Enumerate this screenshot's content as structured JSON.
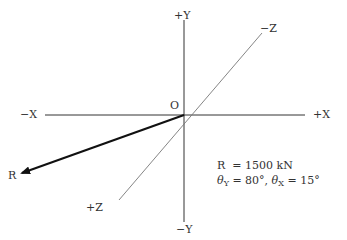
{
  "diagram": {
    "type": "3d-force-vector",
    "origin_label": "O",
    "axes": {
      "pos_y": "+Y",
      "neg_y": "−Y",
      "pos_x": "+X",
      "neg_x": "−X",
      "pos_z": "+Z",
      "neg_z": "−Z"
    },
    "vector": {
      "label": "R",
      "direction": "toward -X, -Y, +Z quadrant"
    },
    "given": {
      "line1_symbol": "R",
      "line1_value": "= 1500 kN",
      "theta_symbol": "θ",
      "theta_y_sub": "Y",
      "theta_y_value": " = 80°, ",
      "theta_x_sub": "X",
      "theta_x_value": " = 15°"
    },
    "colors": {
      "axis": "#333333",
      "z_axis": "#777777",
      "vector": "#111111",
      "background": "#ffffff"
    }
  }
}
